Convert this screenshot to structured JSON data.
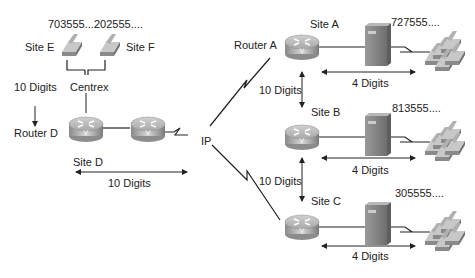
{
  "diagram": {
    "labels": {
      "site_e_number": "703555....",
      "site_f_number": "202555....",
      "site_e": "Site E",
      "site_f": "Site F",
      "centrex": "Centrex",
      "router_d_digits": "10 Digits",
      "router_d": "Router D",
      "site_d": "Site D",
      "site_d_digits": "10 Digits",
      "ip": "IP",
      "router_a": "Router A",
      "site_a": "Site A",
      "site_a_number": "727555....",
      "site_a_digits": "4 Digits",
      "ab_digits": "10 Digits",
      "site_b": "Site B",
      "site_b_number": "813555....",
      "site_b_digits": "4 Digits",
      "bc_digits": "10 Digits",
      "site_c": "Site C",
      "site_c_number": "305555....",
      "site_c_digits": "4 Digits"
    },
    "colors": {
      "line": "#222222",
      "router_top": "#c8c8c8",
      "router_side": "#9a9a9a",
      "pbx": "#8a8a8a",
      "phone": "#a0a0a0"
    }
  }
}
